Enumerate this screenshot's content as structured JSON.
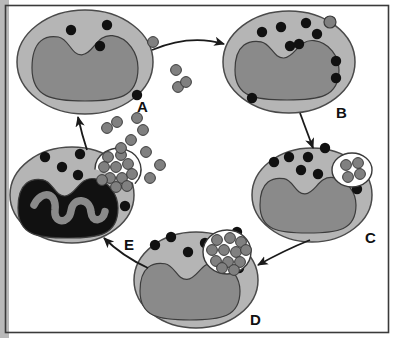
{
  "figure": {
    "background_color": "#ffffff",
    "border_color": "#3a3a3a",
    "left_band_color": "#b9b9b9"
  },
  "palette": {
    "cytoplasm": "#b5b5b5",
    "cytoplasm_outline": "#4a4a4a",
    "nucleus": "#8a8a8a",
    "nucleus_outline": "#3c3c3c",
    "nucleus_dark": "#111111",
    "granule": "#111111",
    "particle": "#808080",
    "particle_outline": "#3a3a3a",
    "vacuole": "#ffffff",
    "vacuole_outline": "#3a3a3a",
    "arrow": "#1a1a1a"
  },
  "stages": [
    {
      "id": "A",
      "label": "A",
      "label_x": 137,
      "label_y": 99,
      "caption": "Resting phagocyte with cytoplasmic granules; free particles nearby",
      "cell": {
        "cx": 85,
        "cy": 62,
        "rx": 68,
        "ry": 52
      },
      "nucleus": {
        "cx": 85,
        "cy": 68,
        "rx": 53,
        "ry": 33,
        "dark": false
      },
      "granules": [
        {
          "x": 71,
          "y": 30
        },
        {
          "x": 107,
          "y": 25
        },
        {
          "x": 100,
          "y": 46
        },
        {
          "x": 137,
          "y": 95
        }
      ],
      "vacuole": null,
      "particles_inside": []
    },
    {
      "id": "B",
      "label": "B",
      "label_x": 336,
      "label_y": 105,
      "caption": "Particle binds to the phagocyte surface membrane",
      "cell": {
        "cx": 289,
        "cy": 62,
        "rx": 66,
        "ry": 51
      },
      "nucleus": {
        "cx": 287,
        "cy": 70,
        "rx": 52,
        "ry": 30,
        "dark": false
      },
      "granules": [
        {
          "x": 262,
          "y": 32
        },
        {
          "x": 281,
          "y": 27
        },
        {
          "x": 306,
          "y": 23
        },
        {
          "x": 317,
          "y": 34
        },
        {
          "x": 290,
          "y": 46
        },
        {
          "x": 299,
          "y": 44
        },
        {
          "x": 336,
          "y": 61
        },
        {
          "x": 336,
          "y": 78
        },
        {
          "x": 252,
          "y": 98
        }
      ],
      "vacuole": null,
      "particles_inside": [],
      "bound_particle": {
        "x": 330,
        "y": 22
      }
    },
    {
      "id": "C",
      "label": "C",
      "label_x": 365,
      "label_y": 230,
      "caption": "Particles internalised into a forming phagosome vacuole",
      "cell": {
        "cx": 312,
        "cy": 195,
        "rx": 60,
        "ry": 47
      },
      "nucleus": {
        "cx": 308,
        "cy": 205,
        "rx": 48,
        "ry": 28,
        "dark": false
      },
      "granules": [
        {
          "x": 274,
          "y": 162
        },
        {
          "x": 289,
          "y": 157
        },
        {
          "x": 308,
          "y": 157
        },
        {
          "x": 325,
          "y": 148
        },
        {
          "x": 301,
          "y": 170
        },
        {
          "x": 318,
          "y": 174
        },
        {
          "x": 357,
          "y": 189
        }
      ],
      "vacuole": {
        "cx": 352,
        "cy": 170,
        "rx": 20,
        "ry": 17
      },
      "particles_inside": [
        {
          "x": 346,
          "y": 165
        },
        {
          "x": 358,
          "y": 163
        },
        {
          "x": 360,
          "y": 174
        },
        {
          "x": 348,
          "y": 177
        }
      ]
    },
    {
      "id": "D",
      "label": "D",
      "label_x": 250,
      "label_y": 312,
      "caption": "Phagosome filled with engulfed particles",
      "cell": {
        "cx": 196,
        "cy": 280,
        "rx": 62,
        "ry": 48
      },
      "nucleus": {
        "cx": 190,
        "cy": 291,
        "rx": 50,
        "ry": 29,
        "dark": false
      },
      "granules": [
        {
          "x": 155,
          "y": 245
        },
        {
          "x": 171,
          "y": 237
        },
        {
          "x": 188,
          "y": 252
        },
        {
          "x": 205,
          "y": 243
        },
        {
          "x": 213,
          "y": 256
        },
        {
          "x": 237,
          "y": 232
        },
        {
          "x": 239,
          "y": 268
        }
      ],
      "vacuole": {
        "cx": 227,
        "cy": 252,
        "rx": 24,
        "ry": 22
      },
      "particles_inside": [
        {
          "x": 217,
          "y": 240
        },
        {
          "x": 230,
          "y": 238
        },
        {
          "x": 241,
          "y": 242
        },
        {
          "x": 212,
          "y": 250
        },
        {
          "x": 224,
          "y": 250
        },
        {
          "x": 236,
          "y": 252
        },
        {
          "x": 246,
          "y": 250
        },
        {
          "x": 216,
          "y": 261
        },
        {
          "x": 228,
          "y": 262
        },
        {
          "x": 240,
          "y": 262
        },
        {
          "x": 222,
          "y": 268
        },
        {
          "x": 234,
          "y": 270
        }
      ]
    },
    {
      "id": "E",
      "label": "E",
      "label_x": 124,
      "label_y": 237,
      "caption": "Dying phagocyte with condensed dark nucleus releases particles",
      "cell": {
        "cx": 72,
        "cy": 195,
        "rx": 62,
        "ry": 48
      },
      "nucleus": {
        "cx": 68,
        "cy": 208,
        "rx": 50,
        "ry": 30,
        "dark": true
      },
      "granules": [
        {
          "x": 45,
          "y": 157
        },
        {
          "x": 62,
          "y": 167
        },
        {
          "x": 80,
          "y": 154
        },
        {
          "x": 78,
          "y": 175
        },
        {
          "x": 125,
          "y": 206
        }
      ],
      "vacuole": {
        "cx": 118,
        "cy": 169,
        "rx": 23,
        "ry": 21,
        "ruptured": true
      },
      "particles_inside": [
        {
          "x": 108,
          "y": 157
        },
        {
          "x": 121,
          "y": 155
        },
        {
          "x": 104,
          "y": 167
        },
        {
          "x": 116,
          "y": 167
        },
        {
          "x": 128,
          "y": 164
        },
        {
          "x": 110,
          "y": 178
        },
        {
          "x": 122,
          "y": 178
        },
        {
          "x": 132,
          "y": 174
        },
        {
          "x": 102,
          "y": 180
        },
        {
          "x": 116,
          "y": 187
        },
        {
          "x": 127,
          "y": 186
        }
      ]
    }
  ],
  "free_particles": [
    {
      "x": 153,
      "y": 42
    },
    {
      "x": 176,
      "y": 70
    },
    {
      "x": 178,
      "y": 87
    },
    {
      "x": 186,
      "y": 82
    },
    {
      "x": 107,
      "y": 128
    },
    {
      "x": 117,
      "y": 122
    },
    {
      "x": 131,
      "y": 140
    },
    {
      "x": 121,
      "y": 148
    },
    {
      "x": 143,
      "y": 130
    },
    {
      "x": 146,
      "y": 152
    },
    {
      "x": 160,
      "y": 165
    },
    {
      "x": 150,
      "y": 178
    },
    {
      "x": 137,
      "y": 118
    }
  ],
  "arrows": [
    {
      "id": "a-to-b",
      "from": "A",
      "to": "B",
      "label": "",
      "path": "M 152 50 Q 190 34 224 44"
    },
    {
      "id": "b-to-c",
      "from": "B",
      "to": "C",
      "label": "",
      "path": "M 300 113 L 313 148"
    },
    {
      "id": "c-to-d",
      "from": "C",
      "to": "D",
      "label": "",
      "path": "M 310 240 Q 285 250 258 265"
    },
    {
      "id": "d-to-e",
      "from": "D",
      "to": "E",
      "label": "",
      "path": "M 148 268 Q 122 256 104 238"
    },
    {
      "id": "e-to-a",
      "from": "E",
      "to": "A",
      "label": "",
      "path": "M 87 150 Q 82 135 78 117"
    }
  ]
}
